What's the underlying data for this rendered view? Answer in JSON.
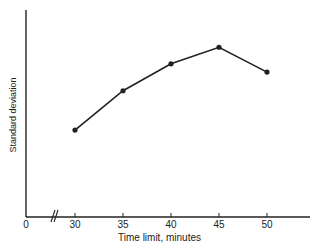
{
  "chart_data": {
    "type": "line",
    "title": "",
    "xlabel": "Time limit, minutes",
    "ylabel": "Standard deviation",
    "x_origin_label": "0",
    "x_axis_break": true,
    "categories": [
      "30",
      "35",
      "40",
      "45",
      "50"
    ],
    "x": [
      30,
      35,
      40,
      45,
      50
    ],
    "series": [
      {
        "name": "Standard deviation",
        "values": [
          42,
          61,
          74,
          82,
          70
        ]
      }
    ],
    "y_units": "relative (no y tick labels shown; 0 = x-axis, 100 = top of y-axis)",
    "ylim": [
      0,
      100
    ],
    "grid": false,
    "legend": null,
    "markers": "filled-circle",
    "line_color": "#222222"
  }
}
